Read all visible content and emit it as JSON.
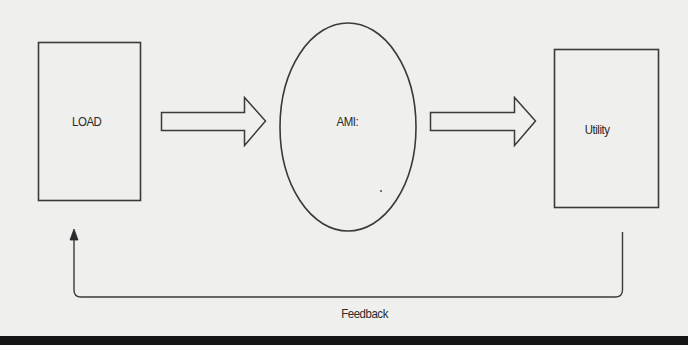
{
  "diagram": {
    "type": "flow",
    "nodes": [
      {
        "id": "load",
        "label": "LOAD",
        "shape": "rectangle"
      },
      {
        "id": "ami",
        "label": "AMI:",
        "shape": "ellipse"
      },
      {
        "id": "utility",
        "label": "Utility",
        "shape": "rectangle"
      }
    ],
    "edges": [
      {
        "from": "load",
        "to": "ami",
        "style": "block-arrow"
      },
      {
        "from": "ami",
        "to": "utility",
        "style": "block-arrow"
      },
      {
        "from": "utility",
        "to": "load",
        "style": "line-arrow",
        "label": "Feedback"
      }
    ],
    "feedback_label": "Feedback"
  },
  "colors": {
    "background": "#efefed",
    "stroke": "#3a3a3a",
    "text": "#2a2a2a",
    "bottom_bar": "#151515"
  }
}
